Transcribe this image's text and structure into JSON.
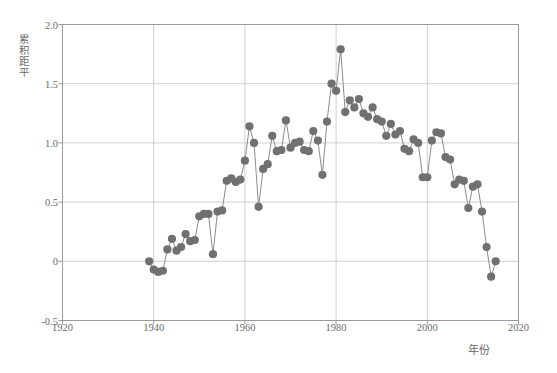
{
  "chart_data": {
    "type": "scatter",
    "title": "",
    "xlabel": "年份",
    "ylabel": "累积距平",
    "xlim": [
      1920,
      2020
    ],
    "ylim": [
      -0.5,
      2.0
    ],
    "xticks": [
      1920,
      1940,
      1960,
      1980,
      2000,
      2020
    ],
    "ytick_labels": [
      "2.0",
      "1.5",
      "1.0",
      "0.5",
      "0",
      "-0.5"
    ],
    "ytick_values": [
      2.0,
      1.5,
      1.0,
      0.5,
      0.0,
      -0.5
    ],
    "grid": true,
    "legend": "none",
    "marker": "circle",
    "marker_color": "#707070",
    "line_color": "#8c8c8c",
    "x": [
      1939,
      1940,
      1941,
      1942,
      1943,
      1944,
      1945,
      1946,
      1947,
      1948,
      1949,
      1950,
      1951,
      1952,
      1953,
      1954,
      1955,
      1956,
      1957,
      1958,
      1959,
      1960,
      1961,
      1962,
      1963,
      1964,
      1965,
      1966,
      1967,
      1968,
      1969,
      1970,
      1971,
      1972,
      1973,
      1974,
      1975,
      1976,
      1977,
      1978,
      1979,
      1980,
      1981,
      1982,
      1983,
      1984,
      1985,
      1986,
      1987,
      1988,
      1989,
      1990,
      1991,
      1992,
      1993,
      1994,
      1995,
      1996,
      1997,
      1998,
      1999,
      2000,
      2001,
      2002,
      2003,
      2004,
      2005,
      2006,
      2007,
      2008,
      2009,
      2010,
      2011,
      2012,
      2013,
      2014,
      2015
    ],
    "y": [
      0.0,
      -0.07,
      -0.09,
      -0.08,
      0.1,
      0.19,
      0.09,
      0.12,
      0.23,
      0.17,
      0.18,
      0.38,
      0.4,
      0.4,
      0.06,
      0.42,
      0.43,
      0.68,
      0.7,
      0.67,
      0.69,
      0.85,
      1.14,
      1.0,
      0.46,
      0.78,
      0.82,
      1.06,
      0.93,
      0.94,
      1.19,
      0.96,
      1.0,
      1.01,
      0.94,
      0.93,
      1.1,
      1.02,
      0.73,
      1.18,
      1.5,
      1.44,
      1.79,
      1.26,
      1.36,
      1.3,
      1.37,
      1.25,
      1.22,
      1.3,
      1.2,
      1.18,
      1.06,
      1.16,
      1.07,
      1.1,
      0.95,
      0.93,
      1.03,
      1.0,
      0.71,
      0.71,
      1.02,
      1.09,
      1.08,
      0.88,
      0.86,
      0.65,
      0.69,
      0.68,
      0.45,
      0.63,
      0.65,
      0.42,
      0.12,
      -0.13,
      0.0
    ]
  },
  "axes": {
    "ylabel_chars": "累积距平",
    "xlabel_text": "年份"
  }
}
